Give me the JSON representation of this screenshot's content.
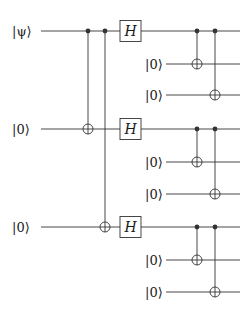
{
  "diagram": {
    "type": "quantum-circuit",
    "colors": {
      "line": "#333333",
      "text": "#1a1a1a",
      "background": "#ffffff"
    },
    "main_qubits": [
      {
        "label": "|ψ⟩",
        "y": 31
      },
      {
        "label": "|0⟩",
        "y": 129
      },
      {
        "label": "|0⟩",
        "y": 227
      }
    ],
    "first_layer_cnots": [
      {
        "control_qubit": 0,
        "target_qubit": 1,
        "x": 88
      },
      {
        "control_qubit": 0,
        "target_qubit": 2,
        "x": 105
      }
    ],
    "hadamard": {
      "label": "H",
      "x": 120,
      "width": 21,
      "height": 21
    },
    "blocks": [
      {
        "main_y": 31,
        "ancillas": [
          {
            "label": "|0⟩",
            "y": 64
          },
          {
            "label": "|0⟩",
            "y": 95
          }
        ],
        "cnots": [
          {
            "x": 197,
            "target_index": 0
          },
          {
            "x": 215,
            "target_index": 1
          }
        ]
      },
      {
        "main_y": 129,
        "ancillas": [
          {
            "label": "|0⟩",
            "y": 162
          },
          {
            "label": "|0⟩",
            "y": 194
          }
        ],
        "cnots": [
          {
            "x": 197,
            "target_index": 0
          },
          {
            "x": 215,
            "target_index": 1
          }
        ]
      },
      {
        "main_y": 227,
        "ancillas": [
          {
            "label": "|0⟩",
            "y": 260
          },
          {
            "label": "|0⟩",
            "y": 292
          }
        ],
        "cnots": [
          {
            "x": 197,
            "target_index": 0
          },
          {
            "x": 215,
            "target_index": 1
          }
        ]
      }
    ]
  }
}
